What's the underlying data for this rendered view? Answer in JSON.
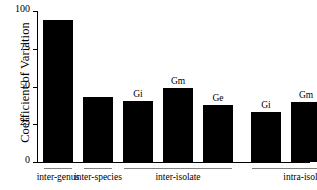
{
  "chart_data": {
    "type": "bar",
    "title": "",
    "xlabel": "",
    "ylabel": "Coefficient of Variation",
    "ylim": [
      0,
      100
    ],
    "yticks": [
      0,
      25,
      50,
      75,
      100
    ],
    "ytick_labels": [
      "0",
      "25",
      "50",
      "75",
      "100"
    ],
    "grid": false,
    "legend": false,
    "bar_color": "#000000",
    "background_color": "#ffffff",
    "categories": [
      "inter-genus",
      "inter-species",
      "inter-isolate Gi",
      "inter-isolate Gm",
      "inter-isolate Ge",
      "intra-isolate Gi",
      "intra-isolate Gm",
      "intra-isolate Ge"
    ],
    "values": [
      94,
      43,
      40.5,
      49,
      38,
      33,
      40,
      38
    ],
    "bar_annotations": [
      "",
      "",
      "Gi",
      "Gm",
      "Ge",
      "Gi",
      "Gm",
      "Ge"
    ],
    "groups": [
      {
        "label": "inter-genus",
        "bar_indices": [
          0
        ]
      },
      {
        "label": "inter-species",
        "bar_indices": [
          1
        ]
      },
      {
        "label": "inter-isolate",
        "bar_indices": [
          2,
          3,
          4
        ]
      },
      {
        "label": "intra-isolate",
        "bar_indices": [
          5,
          6,
          7
        ]
      }
    ]
  },
  "bars": [
    {
      "name": "bar-inter-genus",
      "value": 94,
      "annotation": ""
    },
    {
      "name": "bar-inter-species",
      "value": 43,
      "annotation": ""
    },
    {
      "name": "bar-inter-isolate-gi",
      "value": 40.5,
      "annotation": "Gi"
    },
    {
      "name": "bar-inter-isolate-gm",
      "value": 49,
      "annotation": "Gm"
    },
    {
      "name": "bar-inter-isolate-ge",
      "value": 38,
      "annotation": "Ge"
    },
    {
      "name": "bar-intra-isolate-gi",
      "value": 33,
      "annotation": "Gi"
    },
    {
      "name": "bar-intra-isolate-gm",
      "value": 40,
      "annotation": "Gm"
    },
    {
      "name": "bar-intra-isolate-ge",
      "value": 38,
      "annotation": "Ge"
    }
  ],
  "axis": {
    "y_title": "Coefficient of Variation",
    "y_tick_labels": [
      "100",
      "75",
      "50",
      "25",
      "0"
    ]
  },
  "group_labels": {
    "inter_genus": "inter-genus",
    "inter_species": "inter-species",
    "inter_isolate": "inter-isolate",
    "intra_isolate": "intra-isolate"
  }
}
